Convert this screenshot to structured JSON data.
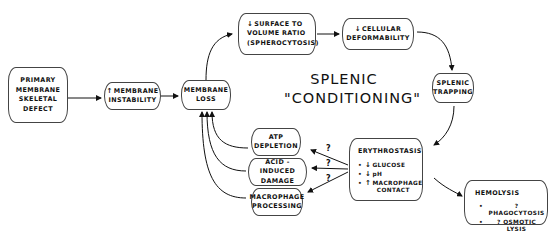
{
  "title": {
    "line1": "SPLENIC",
    "line2": "\"CONDITIONING\""
  },
  "boxes": {
    "primary_defect": [
      "PRIMARY",
      "MEMBRANE",
      "SKELETAL",
      "DEFECT"
    ],
    "membrane_instability": {
      "arrow": "↑",
      "line1": "MEMBRANE",
      "line2": "INSTABILITY"
    },
    "membrane_loss": [
      "MEMBRANE",
      "LOSS"
    ],
    "surface_volume": {
      "arrow": "↓",
      "line1": "SURFACE TO",
      "line2": "VOLUME RATIO",
      "line3": "(SPHEROCYTOSIS)"
    },
    "cellular_deformability": {
      "arrow": "↓",
      "line1": "CELLULAR",
      "line2": "DEFORMABILITY"
    },
    "splenic_trapping": [
      "SPLENIC",
      "TRAPPING"
    ],
    "atp_depletion": [
      "ATP",
      "DEPLETION"
    ],
    "acid_damage": [
      "ACID - INDUCED",
      "DAMAGE"
    ],
    "macrophage_processing": [
      "MACROPHAGE",
      "PROCESSING"
    ],
    "erythrostasis": {
      "heading": "ERYTHROSTASIS",
      "items": [
        {
          "bullet": "•",
          "arrow": "↓",
          "text": "GLUCOSE"
        },
        {
          "bullet": "•",
          "arrow": "↓",
          "text": "pH"
        },
        {
          "bullet": "•",
          "arrow": "↑",
          "text": "MACROPHAGE CONTACT"
        }
      ]
    },
    "hemolysis": {
      "heading": "HEMOLYSIS",
      "items": [
        {
          "bullet": "•",
          "text": "? PHAGOCYTOSIS"
        },
        {
          "bullet": "•",
          "text": "? OSMOTIC LYSIS"
        }
      ]
    }
  },
  "question_marks": [
    "?",
    "?",
    "?"
  ]
}
